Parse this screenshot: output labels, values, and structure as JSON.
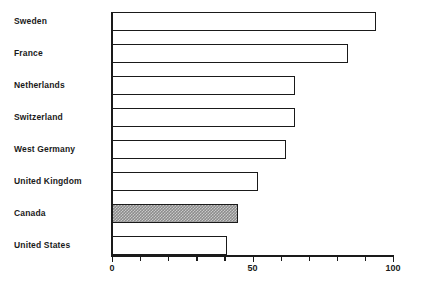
{
  "chart_data": {
    "type": "bar",
    "orientation": "horizontal",
    "title": "",
    "xlabel": "",
    "ylabel": "",
    "xlim": [
      0,
      100
    ],
    "grid": false,
    "legend": null,
    "categories": [
      "Sweden",
      "France",
      "Netherlands",
      "Switzerland",
      "West Germany",
      "United Kingdom",
      "Canada",
      "United States"
    ],
    "values": [
      94,
      84,
      65,
      65,
      62,
      52,
      45,
      41
    ],
    "highlighted_category": "Canada",
    "tick_labels": [
      "0",
      "50",
      "100"
    ],
    "tick_values": [
      0,
      50,
      100
    ],
    "minor_tick_values": [
      10,
      20,
      30,
      40,
      60,
      70,
      80,
      90
    ],
    "colors": {
      "bar_outline": "#1a1a1a",
      "bar_fill": "#ffffff",
      "highlight_fill": "#8c8c8c",
      "axis": "#1a1a1a",
      "text": "#1a1a1a",
      "background": "#ffffff"
    }
  }
}
